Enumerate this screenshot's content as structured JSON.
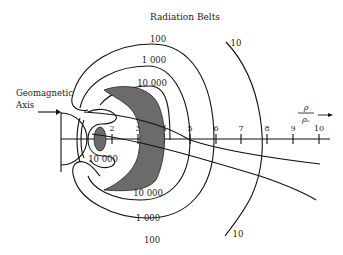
{
  "title": "Radiation Belts",
  "axis_annotation": {
    "label_line1": "Geomagnetic",
    "label_line2": "Axis"
  },
  "x_axis": {
    "label_numerator": "ρ",
    "label_denominator": "ρₑ",
    "ticks": [
      "2",
      "3",
      "4",
      "5",
      "6",
      "7",
      "8",
      "9",
      "10"
    ]
  },
  "contour_labels": {
    "top_100": "100",
    "top_1000": "1 000",
    "top_10000": "10 000",
    "top_10": "10",
    "inner_10000": "10 000",
    "bottom_10000": "10 000",
    "bottom_1000": "1 000",
    "bottom_100": "100",
    "bottom_10": "10"
  },
  "colors": {
    "belt_fill": "#6b6b6b",
    "line": "#111111",
    "background": "#ffffff"
  }
}
